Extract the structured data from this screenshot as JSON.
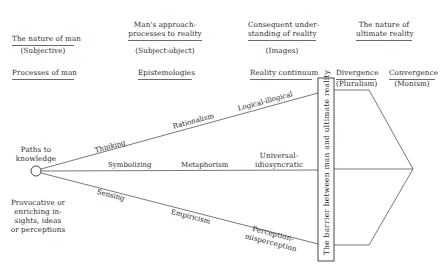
{
  "columns": [
    {
      "header_lines": [
        "The nature of man"
      ],
      "sub": "(Subjective)",
      "row_label": "Processes of man"
    },
    {
      "header_lines": [
        "Man's approach-",
        "processes to reality"
      ],
      "sub": "(Subject-object)",
      "row_label": "Epistemologies"
    },
    {
      "header_lines": [
        "Consequent under-",
        "standing of reality"
      ],
      "sub": "(Images)",
      "row_label": "Reality continuum"
    },
    {
      "header_lines": [
        "The nature of",
        "ultimate reality"
      ],
      "sub": "",
      "row_label": ""
    }
  ],
  "ultimate": {
    "divergence": {
      "label": "Divergence",
      "sub": "(Pluralism)"
    },
    "convergence": {
      "label": "Convergence",
      "sub": "(Monism)"
    }
  },
  "origin": {
    "label_lines": [
      "Paths to",
      "knowledge"
    ],
    "note_lines": [
      "Provocative or",
      "enriching in-",
      "sights, ideas",
      "or perceptions"
    ]
  },
  "paths": [
    {
      "process": "Thinking",
      "epistemology": "Rationalism",
      "continuum": "Logical-illogical"
    },
    {
      "process": "Symbolizing",
      "epistemology": "Metaphorism",
      "continuum_lines": [
        "Universal-",
        "idiosyncratic"
      ]
    },
    {
      "process": "Sensing",
      "epistemology": "Empiricism",
      "continuum_lines": [
        "Perception-",
        "misperception"
      ]
    }
  ],
  "barrier": {
    "label": "The barrier between man and ultimate reality"
  },
  "colors": {
    "ink": "#2a2a2a",
    "line": "#555555",
    "background": "#ffffff"
  }
}
